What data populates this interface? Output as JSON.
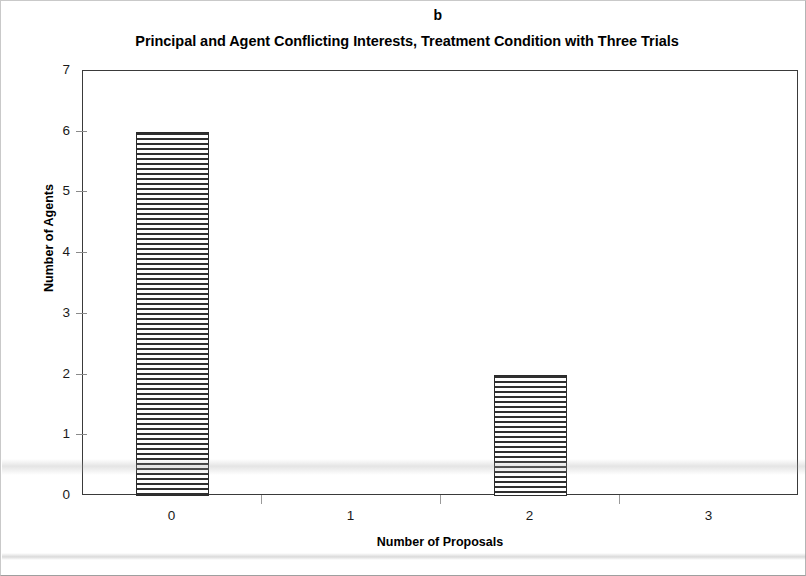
{
  "panel_label": "b",
  "chart_data": {
    "type": "bar",
    "title": "Principal and Agent Conflicting Interests, Treatment Condition with Three Trials",
    "panel": "b",
    "xlabel": "Number of Proposals",
    "ylabel": "Number of Agents",
    "categories": [
      "0",
      "1",
      "2",
      "3"
    ],
    "values": [
      6,
      0,
      2,
      0
    ],
    "ylim": [
      0,
      7
    ],
    "ytick_labels": [
      "0",
      "1",
      "2",
      "3",
      "4",
      "5",
      "6",
      "7"
    ],
    "ytick_values": [
      0,
      1,
      2,
      3,
      4,
      5,
      6,
      7
    ],
    "xtick_labels": [
      "0",
      "1",
      "2",
      "3"
    ],
    "grid": false,
    "legend": false,
    "bar_fill": "horizontal-hatch",
    "bar_edge_color": "#2b2b2b",
    "bar_fill_color": "#ffffff",
    "hatch_color": "#2f2f2f",
    "axis_color": "#3a3a3a",
    "background_color": "#ffffff"
  }
}
